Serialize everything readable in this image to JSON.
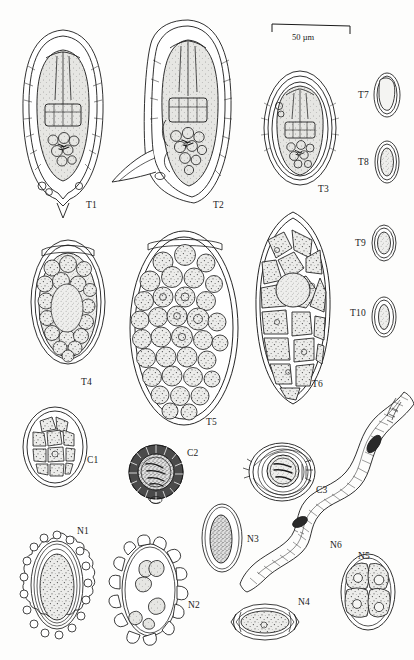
{
  "plate": {
    "title": "Helminth egg and larva identification plate",
    "background_color": "#fdfdfc",
    "ink_color": "#1a1a1a",
    "fill_color": "#e9e9e6",
    "width": 414,
    "height": 660
  },
  "scale_bar": {
    "label": "50 µm",
    "x": 272,
    "y": 28,
    "length_px": 78
  },
  "specimens": [
    {
      "id": "T1",
      "label": "T1",
      "group": "Taeniid",
      "shape": "lemon-oval-pointed",
      "cx": 63,
      "cy": 118,
      "rx": 40,
      "ry": 88,
      "label_x": 86,
      "label_y": 200,
      "description": "Taeniid-type egg, thick striated shell, oncosphere with hooks, pointed basal projection"
    },
    {
      "id": "T2",
      "label": "T2",
      "group": "Taeniid",
      "shape": "oval-with-spur",
      "cx": 188,
      "cy": 112,
      "rx": 42,
      "ry": 92,
      "label_x": 213,
      "label_y": 200,
      "description": "Taeniid-type egg with lateral spur and hooked oncosphere"
    },
    {
      "id": "T3",
      "label": "T3",
      "group": "Taeniid",
      "shape": "broad-oval",
      "cx": 300,
      "cy": 128,
      "rx": 36,
      "ry": 57,
      "label_x": 318,
      "label_y": 184,
      "description": "Rounded taeniid egg, multilayered shell, six-hooked oncosphere"
    },
    {
      "id": "T4",
      "label": "T4",
      "group": "Taeniid",
      "shape": "oval-granular",
      "cx": 68,
      "cy": 302,
      "rx": 37,
      "ry": 62,
      "label_x": 81,
      "label_y": 377,
      "description": "Oval egg filled with rounded granular blastomeres"
    },
    {
      "id": "T5",
      "label": "T5",
      "group": "Taeniid",
      "shape": "large-oval-morula",
      "cx": 184,
      "cy": 328,
      "rx": 54,
      "ry": 97,
      "label_x": 206,
      "label_y": 417,
      "description": "Large oval egg packed with numerous spherical morula cells"
    },
    {
      "id": "T6",
      "label": "T6",
      "group": "Taeniid",
      "shape": "elongate-polygonal",
      "cx": 293,
      "cy": 308,
      "rx": 37,
      "ry": 96,
      "label_x": 312,
      "label_y": 379,
      "description": "Elongate egg with large polygonal blastomeres"
    },
    {
      "id": "T7",
      "label": "T7",
      "group": "Taeniid",
      "shape": "small-oval",
      "cx": 387,
      "cy": 95,
      "rx": 13,
      "ry": 22,
      "label_x": 358,
      "label_y": 97,
      "description": "Small oval thin-shelled egg"
    },
    {
      "id": "T8",
      "label": "T8",
      "group": "Taeniid",
      "shape": "small-oval",
      "cx": 387,
      "cy": 162,
      "rx": 12,
      "ry": 21,
      "label_x": 358,
      "label_y": 164,
      "description": "Small oval egg with granular contents"
    },
    {
      "id": "T9",
      "label": "T9",
      "group": "Taeniid",
      "shape": "small-oval",
      "cx": 384,
      "cy": 243,
      "rx": 12,
      "ry": 18,
      "label_x": 355,
      "label_y": 245,
      "description": "Small rounded egg, double-walled shell"
    },
    {
      "id": "T10",
      "label": "T10",
      "group": "Taeniid",
      "shape": "small-oval",
      "cx": 384,
      "cy": 317,
      "rx": 12,
      "ry": 20,
      "label_x": 352,
      "label_y": 313,
      "description": "Small oval egg with central ovum"
    },
    {
      "id": "C1",
      "label": "C1",
      "group": "Cestode",
      "shape": "oval-cellular",
      "cx": 55,
      "cy": 447,
      "rx": 32,
      "ry": 40,
      "label_x": 87,
      "label_y": 455,
      "description": "Oval cestode egg with polygonal inner cells"
    },
    {
      "id": "C2",
      "label": "C2",
      "group": "Cestode",
      "shape": "round-radial-striated",
      "cx": 156,
      "cy": 472,
      "rx": 27,
      "ry": 27,
      "label_x": 187,
      "label_y": 453,
      "description": "Round thick radially-striated embryophore with hooked oncosphere"
    },
    {
      "id": "C3",
      "label": "C3",
      "group": "Cestode",
      "shape": "round-concentric",
      "cx": 282,
      "cy": 472,
      "rx": 33,
      "ry": 29,
      "label_x": 316,
      "label_y": 490,
      "description": "Rounded egg with concentric membranes and hooked oncosphere"
    },
    {
      "id": "N1",
      "label": "N1",
      "group": "Nematode",
      "shape": "mammillated-oval",
      "cx": 57,
      "cy": 585,
      "rx": 33,
      "ry": 52,
      "label_x": 77,
      "label_y": 531,
      "description": "Oval egg with bumpy mammillated outer albuminous coat"
    },
    {
      "id": "N2",
      "label": "N2",
      "group": "Nematode",
      "shape": "knobbed-oval",
      "cx": 150,
      "cy": 590,
      "rx": 34,
      "ry": 54,
      "label_x": 188,
      "label_y": 605,
      "description": "Oval egg with large irregular surface knobs and internal blastomeres"
    },
    {
      "id": "N3",
      "label": "N3",
      "group": "Nematode",
      "shape": "narrow-oval",
      "cx": 222,
      "cy": 538,
      "rx": 20,
      "ry": 34,
      "label_x": 247,
      "label_y": 540,
      "description": "Narrow oval egg with dense granular ovum"
    },
    {
      "id": "N4",
      "label": "N4",
      "group": "Nematode",
      "shape": "barrel-with-plugs",
      "cx": 265,
      "cy": 622,
      "rx": 34,
      "ry": 17,
      "label_x": 298,
      "label_y": 602,
      "description": "Barrel-shaped egg with bipolar plugs"
    },
    {
      "id": "N5",
      "label": "N5",
      "group": "Nematode",
      "shape": "oval-four-cell",
      "cx": 368,
      "cy": 592,
      "rx": 27,
      "ry": 38,
      "label_x": 358,
      "label_y": 556,
      "description": "Oval egg at four-blastomere stage"
    },
    {
      "id": "N6",
      "label": "N6",
      "group": "Nematode",
      "shape": "sinuous-larva",
      "cx": 340,
      "cy": 490,
      "rx": 0,
      "ry": 0,
      "label_x": 333,
      "label_y": 545,
      "description": "Sinuous rhabditiform nematode larva with buccal cavity and genital primordium"
    }
  ]
}
